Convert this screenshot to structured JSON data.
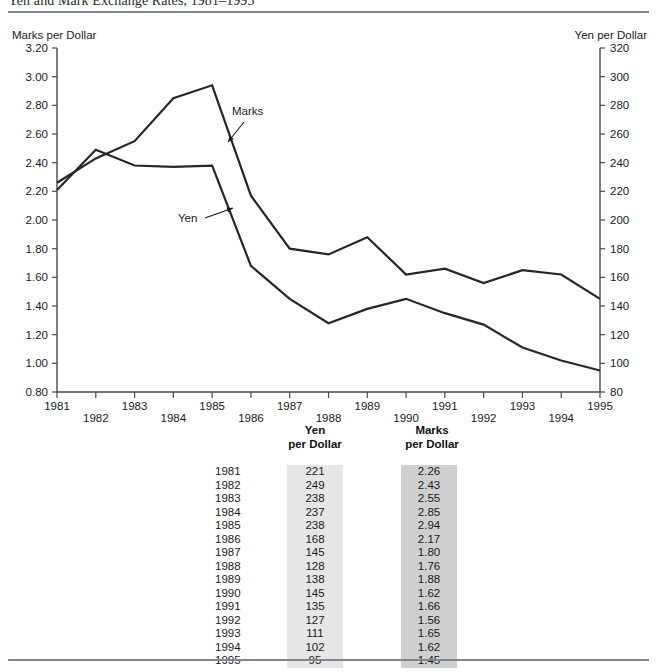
{
  "figure": {
    "title": "Yen and Mark Exchange Rates, 1981–1995"
  },
  "chart_data": {
    "type": "line",
    "title": "Yen and Mark Exchange Rates, 1981–1995",
    "xlabel": "",
    "left_axis_title": "Marks per Dollar",
    "right_axis_title": "Yen  per Dollar",
    "categories": [
      "1981",
      "1982",
      "1983",
      "1984",
      "1985",
      "1986",
      "1987",
      "1988",
      "1989",
      "1990",
      "1991",
      "1992",
      "1993",
      "1994",
      "1995"
    ],
    "x_tick_labels": [
      "1981",
      "1982",
      "1983",
      "1984",
      "1985",
      "1986",
      "1987",
      "1988",
      "1989",
      "1990",
      "1991",
      "1992",
      "1993",
      "1994",
      "1995"
    ],
    "left_ylim": [
      0.8,
      3.2
    ],
    "left_ticks": [
      "0.80",
      "1.00",
      "1.20",
      "1.40",
      "1.60",
      "1.80",
      "2.00",
      "2.20",
      "2.40",
      "2.60",
      "2.80",
      "3.00",
      "3.20"
    ],
    "right_ylim": [
      80,
      320
    ],
    "right_ticks": [
      "80",
      "100",
      "120",
      "140",
      "160",
      "180",
      "200",
      "220",
      "240",
      "260",
      "280",
      "300",
      "320"
    ],
    "grid": false,
    "legend": "in-plot annotations",
    "annotations": [
      {
        "text": "Marks",
        "x": 1986.0,
        "y_left": 2.68
      },
      {
        "text": "Yen",
        "x": 1985.0,
        "y_left": 2.0
      }
    ],
    "series": [
      {
        "name": "Marks",
        "axis": "left",
        "unit": "Marks per Dollar",
        "values": [
          2.26,
          2.43,
          2.55,
          2.85,
          2.94,
          2.17,
          1.8,
          1.76,
          1.88,
          1.62,
          1.66,
          1.56,
          1.65,
          1.62,
          1.45
        ]
      },
      {
        "name": "Yen",
        "axis": "right",
        "unit": "Yen per Dollar",
        "values": [
          221,
          249,
          238,
          237,
          238,
          168,
          145,
          128,
          138,
          145,
          135,
          127,
          111,
          102,
          95
        ]
      }
    ]
  },
  "table": {
    "header": {
      "year": "",
      "yen_line1": "Yen",
      "yen_line2": "per Dollar",
      "marks_line1": "Marks",
      "marks_line2": "per Dollar"
    },
    "rows": [
      {
        "year": "1981",
        "yen": "221",
        "marks": "2.26"
      },
      {
        "year": "1982",
        "yen": "249",
        "marks": "2.43"
      },
      {
        "year": "1983",
        "yen": "238",
        "marks": "2.55"
      },
      {
        "year": "1984",
        "yen": "237",
        "marks": "2.85"
      },
      {
        "year": "1985",
        "yen": "238",
        "marks": "2.94"
      },
      {
        "year": "1986",
        "yen": "168",
        "marks": "2.17"
      },
      {
        "year": "1987",
        "yen": "145",
        "marks": "1.80"
      },
      {
        "year": "1988",
        "yen": "128",
        "marks": "1.76"
      },
      {
        "year": "1989",
        "yen": "138",
        "marks": "1.88"
      },
      {
        "year": "1990",
        "yen": "145",
        "marks": "1.62"
      },
      {
        "year": "1991",
        "yen": "135",
        "marks": "1.66"
      },
      {
        "year": "1992",
        "yen": "127",
        "marks": "1.56"
      },
      {
        "year": "1993",
        "yen": "111",
        "marks": "1.65"
      },
      {
        "year": "1994",
        "yen": "102",
        "marks": "1.62"
      },
      {
        "year": "1995",
        "yen": "95",
        "marks": "1.45"
      }
    ]
  },
  "colors": {
    "line": "#262626",
    "axis": "#4a4a4a",
    "rule": "#7d8791",
    "yen_column_shade": "#e6e6e6",
    "marks_column_shade": "#cfcfcf",
    "text": "#1a1a1a"
  }
}
